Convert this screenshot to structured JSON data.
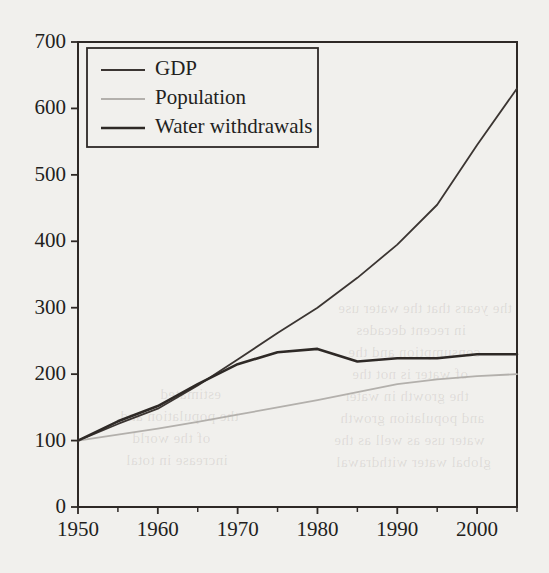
{
  "chart_data": {
    "type": "line",
    "title": "",
    "subtitle": "",
    "xlabel": "",
    "ylabel": "",
    "xlim": [
      1950,
      2005
    ],
    "ylim": [
      0,
      700
    ],
    "grid": false,
    "legend_position": "top-left",
    "index_note": "Index, 1950 = 100",
    "xticks": [
      1950,
      1960,
      1970,
      1980,
      1990,
      2000
    ],
    "xtick_labels": [
      "1950",
      "1960",
      "1970",
      "1980",
      "1990",
      "2000"
    ],
    "xminor_ticks": [
      1955,
      1965,
      1975,
      1985,
      1995,
      2005
    ],
    "yticks": [
      0,
      100,
      200,
      300,
      400,
      500,
      600,
      700
    ],
    "ytick_labels": [
      "0",
      "100",
      "200",
      "300",
      "400",
      "500",
      "600",
      "700"
    ],
    "series": [
      {
        "name": "GDP",
        "color": "#3b3532",
        "width": 1.8,
        "x": [
          1950,
          1955,
          1960,
          1965,
          1970,
          1975,
          1980,
          1985,
          1990,
          1995,
          2000,
          2005
        ],
        "values": [
          100,
          125,
          148,
          183,
          222,
          262,
          300,
          345,
          395,
          455,
          545,
          630
        ]
      },
      {
        "name": "Population",
        "color": "#b3b0ac",
        "width": 1.8,
        "x": [
          1950,
          1955,
          1960,
          1965,
          1970,
          1975,
          1980,
          1985,
          1990,
          1995,
          2000,
          2005
        ],
        "values": [
          100,
          109,
          118,
          128,
          139,
          150,
          161,
          173,
          185,
          192,
          197,
          200
        ]
      },
      {
        "name": "Water withdrawals",
        "color": "#2e2926",
        "width": 2.6,
        "x": [
          1950,
          1955,
          1960,
          1965,
          1970,
          1975,
          1980,
          1985,
          1990,
          1995,
          2000,
          2005
        ],
        "values": [
          100,
          129,
          152,
          185,
          215,
          233,
          238,
          219,
          224,
          224,
          230,
          230
        ]
      }
    ],
    "legend_entries": [
      {
        "label": "GDP",
        "color": "#3b3532",
        "width": 1.8
      },
      {
        "label": "Population",
        "color": "#b3b0ac",
        "width": 1.8
      },
      {
        "label": "Water withdrawals",
        "color": "#2e2926",
        "width": 2.6
      }
    ]
  },
  "bleed_text": [
    {
      "text": "the years that the water use",
      "x": 338,
      "y": 300
    },
    {
      "text": "in recent decades",
      "x": 356,
      "y": 322
    },
    {
      "text": "consumption and the",
      "x": 348,
      "y": 344
    },
    {
      "text": "of water is not the",
      "x": 352,
      "y": 366
    },
    {
      "text": "the growth in water",
      "x": 344,
      "y": 388
    },
    {
      "text": "and population growth",
      "x": 340,
      "y": 410
    },
    {
      "text": "water use as well as the",
      "x": 334,
      "y": 432
    },
    {
      "text": "global water withdrawal",
      "x": 336,
      "y": 454
    },
    {
      "text": "the population and",
      "x": 120,
      "y": 408
    },
    {
      "text": "estimated",
      "x": 160,
      "y": 386
    },
    {
      "text": "of the world",
      "x": 132,
      "y": 430
    },
    {
      "text": "increase in total",
      "x": 126,
      "y": 452
    }
  ]
}
